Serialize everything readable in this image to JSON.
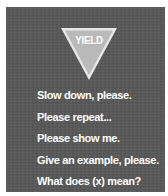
{
  "sign": {
    "label": "YIELD",
    "shape": "inverted-triangle",
    "fill_color": "#b9b9b9",
    "border_color": "#e6e6e6"
  },
  "colors": {
    "background": "#585858",
    "text": "#ffffff",
    "margin": "#ffffff"
  },
  "phrases": [
    {
      "text": "Slow down, please."
    },
    {
      "text": "Please repeat..."
    },
    {
      "text": "Please show me."
    },
    {
      "text": "Give an example, please."
    },
    {
      "text": "What does (x) mean?"
    }
  ]
}
